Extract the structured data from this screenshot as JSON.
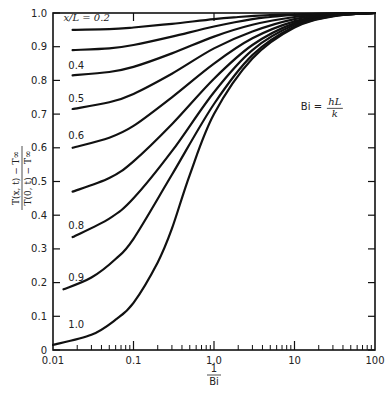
{
  "chart_data": {
    "type": "line",
    "title": "",
    "xlabel": "1/Bi",
    "xlabel_num": "1",
    "xlabel_den": "Bi",
    "ylabel_num": "T(x, t) − T∞",
    "ylabel_den": "T(0, t) − T∞",
    "xscale": "log",
    "xlim": [
      0.01,
      100
    ],
    "ylim": [
      0,
      1.0
    ],
    "grid": false,
    "x_ticks": [
      0.01,
      0.1,
      1.0,
      10,
      100
    ],
    "x_tick_labels": [
      "0.01",
      "0.1",
      "1.0",
      "10",
      "100"
    ],
    "y_ticks": [
      0,
      0.1,
      0.2,
      0.3,
      0.4,
      0.5,
      0.6,
      0.7,
      0.8,
      0.9,
      1.0
    ],
    "y_tick_labels": [
      "0",
      "0.1",
      "0.2",
      "0.3",
      "0.4",
      "0.5",
      "0.6",
      "0.7",
      "0.8",
      "0.9",
      "1.0"
    ],
    "annotation": {
      "text": "Bi =",
      "frac_num": "hL",
      "frac_den": "k",
      "x": 12,
      "y": 0.72
    },
    "series": [
      {
        "name": "x/L = 0.2",
        "label": "x/L = 0.2",
        "label_pos": [
          0.0135,
          0.975
        ],
        "x": [
          0.0175,
          0.05,
          0.1,
          0.3,
          1.0,
          2.0,
          5,
          10,
          30,
          100
        ],
        "y": [
          0.95,
          0.952,
          0.957,
          0.968,
          0.982,
          0.988,
          0.994,
          0.996,
          0.999,
          1.0
        ]
      },
      {
        "name": "x/L = 0.3",
        "label": "",
        "label_pos": null,
        "x": [
          0.0175,
          0.05,
          0.1,
          0.3,
          1.0,
          3.0,
          5,
          10,
          30,
          100
        ],
        "y": [
          0.89,
          0.895,
          0.905,
          0.93,
          0.96,
          0.982,
          0.988,
          0.994,
          0.998,
          1.0
        ]
      },
      {
        "name": "x/L = 0.4",
        "label": "0.4",
        "label_pos": [
          0.0155,
          0.835
        ],
        "x": [
          0.0175,
          0.05,
          0.1,
          0.3,
          1.0,
          3.0,
          10,
          30,
          100
        ],
        "y": [
          0.815,
          0.825,
          0.84,
          0.88,
          0.93,
          0.965,
          0.988,
          0.997,
          1.0
        ]
      },
      {
        "name": "x/L = 0.5",
        "label": "0.5",
        "label_pos": [
          0.0155,
          0.735
        ],
        "x": [
          0.0175,
          0.05,
          0.1,
          0.3,
          1.0,
          3.0,
          10,
          30,
          100
        ],
        "y": [
          0.715,
          0.735,
          0.76,
          0.82,
          0.895,
          0.945,
          0.982,
          0.996,
          1.0
        ]
      },
      {
        "name": "x/L = 0.6",
        "label": "0.6",
        "label_pos": [
          0.0155,
          0.625
        ],
        "x": [
          0.0175,
          0.05,
          0.1,
          0.3,
          1.0,
          3.0,
          10,
          30,
          100
        ],
        "y": [
          0.6,
          0.63,
          0.665,
          0.75,
          0.85,
          0.925,
          0.975,
          0.994,
          1.0
        ]
      },
      {
        "name": "x/L = 0.7",
        "label": "",
        "label_pos": null,
        "x": [
          0.0175,
          0.05,
          0.1,
          0.3,
          1.0,
          3.0,
          10,
          30,
          100
        ],
        "y": [
          0.47,
          0.51,
          0.56,
          0.67,
          0.805,
          0.905,
          0.97,
          0.993,
          1.0
        ]
      },
      {
        "name": "x/L = 0.8",
        "label": "0.8",
        "label_pos": [
          0.0155,
          0.36
        ],
        "x": [
          0.0175,
          0.05,
          0.1,
          0.3,
          1.0,
          3.0,
          10,
          30,
          100
        ],
        "y": [
          0.335,
          0.39,
          0.45,
          0.59,
          0.765,
          0.89,
          0.965,
          0.992,
          1.0
        ]
      },
      {
        "name": "x/L = 0.9",
        "label": "0.9",
        "label_pos": [
          0.0155,
          0.205
        ],
        "x": [
          0.0135,
          0.03,
          0.06,
          0.1,
          0.3,
          1.0,
          3.0,
          10,
          30,
          100
        ],
        "y": [
          0.18,
          0.215,
          0.27,
          0.33,
          0.52,
          0.73,
          0.875,
          0.96,
          0.991,
          1.0
        ]
      },
      {
        "name": "x/L = 1.0",
        "label": "1.0",
        "label_pos": [
          0.0155,
          0.065
        ],
        "x": [
          0.01,
          0.03,
          0.06,
          0.1,
          0.2,
          0.3,
          0.5,
          1.0,
          3.0,
          10,
          30,
          100
        ],
        "y": [
          0.015,
          0.045,
          0.09,
          0.14,
          0.26,
          0.36,
          0.52,
          0.7,
          0.865,
          0.957,
          0.99,
          1.0
        ]
      }
    ]
  }
}
